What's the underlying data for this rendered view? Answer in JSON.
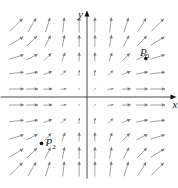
{
  "diagram": {
    "type": "vector_field",
    "field": {
      "fx": "x^2",
      "fy": "y^2"
    },
    "grid": {
      "x_samples": [
        -4.5,
        -3.5,
        -2.5,
        -1.5,
        -0.5,
        0.5,
        1.5,
        2.5,
        3.5,
        4.5
      ],
      "y_samples": [
        -4.5,
        -3.5,
        -2.5,
        -1.5,
        -0.5,
        0.5,
        1.5,
        2.5,
        3.5,
        4.5
      ]
    },
    "axes": {
      "x_label": "x",
      "y_label": "y",
      "x_range": [
        -5.5,
        5.7
      ],
      "y_range": [
        -5.1,
        5.4
      ]
    },
    "points": [
      {
        "id": "P1",
        "label": "P",
        "subscript": "1",
        "x": 3.75,
        "y": 2.4
      },
      {
        "id": "P2",
        "label": "P",
        "subscript": "2",
        "x": -2.9,
        "y": -2.9
      }
    ],
    "colors": {
      "arrow": "#8a8a8a",
      "axis": "#333333",
      "point": "#111111"
    }
  }
}
